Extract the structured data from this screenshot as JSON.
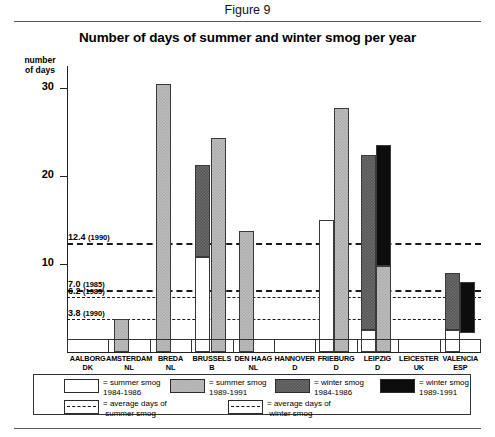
{
  "figure_label": "Figure 9",
  "title": "Number of days of summer and winter smog per year",
  "axis_caption_line1": "number",
  "axis_caption_line2": "of days",
  "legend": {
    "items": [
      {
        "swatch": "white",
        "label_line1": "= summer smog",
        "label_line2": "1984-1986"
      },
      {
        "swatch": "lgray",
        "label_line1": "= summer smog",
        "label_line2": "1989-1991"
      },
      {
        "swatch": "dgray",
        "label_line1": "= winter smog",
        "label_line2": "1984-1986"
      },
      {
        "swatch": "black",
        "label_line1": "= winter smog",
        "label_line2": "1989-1991"
      }
    ],
    "average_items": [
      {
        "swatch": "dashed",
        "label_line1": "= average days of",
        "label_line2": "summer smog"
      },
      {
        "swatch": "dashed",
        "label_line1": "= average days of",
        "label_line2": "winter smog"
      }
    ]
  },
  "chart_data": {
    "type": "bar",
    "title": "Number of days of summer and winter smog per year",
    "xlabel": "",
    "ylabel": "number of days",
    "ylim": [
      0,
      32.5
    ],
    "yticks": [
      10,
      20,
      30
    ],
    "ytick_labels": [
      "10",
      "20",
      "30"
    ],
    "grid": false,
    "legend_position": "bottom",
    "categories": [
      {
        "city": "AALBORG",
        "country": "DK"
      },
      {
        "city": "AMSTERDAM",
        "country": "NL"
      },
      {
        "city": "BREDA",
        "country": "NL"
      },
      {
        "city": "BRUSSELS",
        "country": "B"
      },
      {
        "city": "DEN HAAG",
        "country": "NL"
      },
      {
        "city": "HANNOVER",
        "country": "D"
      },
      {
        "city": "FRIEBURG",
        "country": "D"
      },
      {
        "city": "LEIPZIG",
        "country": "D"
      },
      {
        "city": "LEICESTER",
        "country": "UK"
      },
      {
        "city": "VALENCIA",
        "country": "ESP"
      }
    ],
    "series": [
      {
        "name": "summer smog 1984-1986",
        "swatch": "white",
        "values": [
          null,
          null,
          null,
          null,
          null,
          null,
          15.0,
          null,
          null,
          null
        ]
      },
      {
        "name": "summer smog 1989-1991",
        "swatch": "lgray",
        "values": [
          null,
          3.8,
          30.5,
          24.3,
          13.8,
          null,
          27.7,
          9.8,
          null,
          5.8
        ]
      },
      {
        "name": "winter smog 1984-1986",
        "swatch": "dgray",
        "values": [
          null,
          null,
          null,
          21.3,
          null,
          null,
          null,
          22.4,
          null,
          9.0
        ]
      },
      {
        "name": "winter smog 1989-1991",
        "swatch": "black",
        "values": [
          null,
          null,
          null,
          null,
          null,
          null,
          null,
          23.5,
          null,
          8.0
        ]
      }
    ],
    "stack_notes": [
      {
        "city": "BRUSSELS",
        "series": "winter smog 1984-1986",
        "from": 10.8,
        "to": 21.3
      },
      {
        "city": "LEIPZIG",
        "series": "winter smog 1984-1986",
        "from": 2.5,
        "to": 22.4
      },
      {
        "city": "LEIPZIG",
        "series": "winter smog 1989-1991",
        "from": 9.8,
        "to": 23.5
      },
      {
        "city": "VALENCIA",
        "series": "winter smog 1984-1986",
        "from": 2.5,
        "to": 9.0
      },
      {
        "city": "VALENCIA",
        "series": "winter smog 1989-1991",
        "from": 2.2,
        "to": 8.0
      }
    ],
    "reference_lines": [
      {
        "value": 12.4,
        "label": "12.4",
        "year": "(1990)",
        "type": "average summer smog"
      },
      {
        "value": 7.0,
        "label": "7.0",
        "year": "(1985)",
        "type": "average summer smog"
      },
      {
        "value": 6.2,
        "label": "6.2",
        "year": "(1985)",
        "type": "average winter smog"
      },
      {
        "value": 3.8,
        "label": "3.8",
        "year": "(1990)",
        "type": "average winter smog"
      }
    ]
  }
}
